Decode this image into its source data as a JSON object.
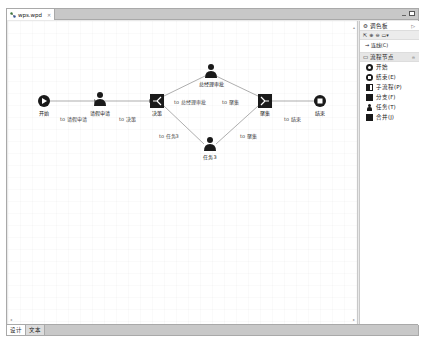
{
  "editor": {
    "tab_title": "wps.wpd",
    "tab_close": "✕",
    "bottom_tabs": [
      {
        "label": "设计",
        "active": true
      },
      {
        "label": "文本",
        "active": false
      }
    ]
  },
  "palette": {
    "title": "调色板",
    "tools": [
      "select",
      "zoom-in",
      "zoom-out",
      "marquee"
    ],
    "connection_label": "→ 连线(C)",
    "drawer_title": "流程节点",
    "items": [
      {
        "label": "开始",
        "icon": "start-icon"
      },
      {
        "label": "结束(E)",
        "icon": "end-icon"
      },
      {
        "label": "子流程(P)",
        "icon": "subprocess-icon"
      },
      {
        "label": "分支(F)",
        "icon": "fork-icon"
      },
      {
        "label": "任务(T)",
        "icon": "task-icon"
      },
      {
        "label": "合并(J)",
        "icon": "join-icon"
      }
    ]
  },
  "diagram": {
    "nodes": [
      {
        "id": "start",
        "label": "开始",
        "type": "start"
      },
      {
        "id": "apply",
        "label": "请假申请",
        "type": "task"
      },
      {
        "id": "decide",
        "label": "决策",
        "type": "fork"
      },
      {
        "id": "gm",
        "label": "总经理审批",
        "type": "task"
      },
      {
        "id": "task3",
        "label": "任务3",
        "type": "task"
      },
      {
        "id": "merge",
        "label": "聚集",
        "type": "join"
      },
      {
        "id": "end",
        "label": "结束",
        "type": "end"
      }
    ],
    "edges": [
      {
        "from": "start",
        "to": "apply",
        "label": "to 请假申请"
      },
      {
        "from": "apply",
        "to": "decide",
        "label": "to 决策"
      },
      {
        "from": "decide",
        "to": "gm",
        "label": "to 总经理审批"
      },
      {
        "from": "decide",
        "to": "task3",
        "label": "to 任务3"
      },
      {
        "from": "gm",
        "to": "merge",
        "label": "to 聚集"
      },
      {
        "from": "task3",
        "to": "merge",
        "label": "to 聚集"
      },
      {
        "from": "merge",
        "to": "end",
        "label": "to 结束"
      }
    ]
  }
}
